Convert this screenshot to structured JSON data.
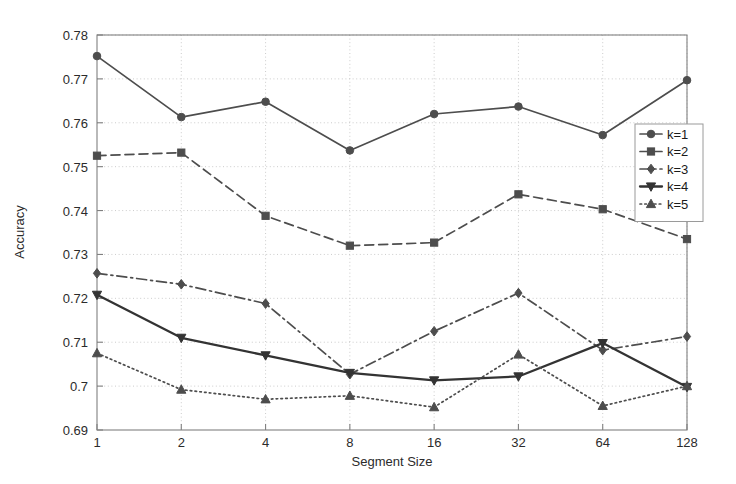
{
  "chart_data": {
    "type": "line",
    "title": "",
    "xlabel": "Segment Size",
    "ylabel": "Accuracy",
    "x": [
      1,
      2,
      4,
      8,
      16,
      32,
      64,
      128
    ],
    "xtick_labels": [
      "1",
      "2",
      "4",
      "8",
      "16",
      "32",
      "64",
      "128"
    ],
    "xscale": "log2-categorical",
    "ytick_labels": [
      "0.69",
      "0.7",
      "0.71",
      "0.72",
      "0.73",
      "0.74",
      "0.75",
      "0.76",
      "0.77",
      "0.78"
    ],
    "ytick_values": [
      0.69,
      0.7,
      0.71,
      0.72,
      0.73,
      0.74,
      0.75,
      0.76,
      0.77,
      0.78
    ],
    "ylim": [
      0.69,
      0.78
    ],
    "grid": true,
    "grid_style": "dotted",
    "legend_position": "center-right",
    "series": [
      {
        "name": "k=1",
        "label": "k=1",
        "linestyle": "solid",
        "marker": "circle",
        "color": "#4d4d4d",
        "values": [
          0.7752,
          0.7613,
          0.7648,
          0.7537,
          0.762,
          0.7637,
          0.7572,
          0.7697
        ]
      },
      {
        "name": "k=2",
        "label": "k=2",
        "linestyle": "dashed",
        "marker": "square",
        "color": "#4d4d4d",
        "values": [
          0.7525,
          0.7532,
          0.7388,
          0.732,
          0.7327,
          0.7437,
          0.7403,
          0.7335
        ]
      },
      {
        "name": "k=3",
        "label": "k=3",
        "linestyle": "dashdot",
        "marker": "diamond",
        "color": "#4d4d4d",
        "values": [
          0.7257,
          0.7232,
          0.7188,
          0.7027,
          0.7125,
          0.7212,
          0.7082,
          0.7113
        ]
      },
      {
        "name": "k=4",
        "label": "k=4",
        "linestyle": "solid-bold",
        "marker": "triangle-down",
        "color": "#333333",
        "values": [
          0.7208,
          0.711,
          0.707,
          0.703,
          0.7013,
          0.7022,
          0.7098,
          0.6998
        ]
      },
      {
        "name": "k=5",
        "label": "k=5",
        "linestyle": "dotted",
        "marker": "triangle-up",
        "color": "#4d4d4d",
        "values": [
          0.7075,
          0.6992,
          0.697,
          0.6978,
          0.6952,
          0.7072,
          0.6955,
          0.7
        ]
      }
    ]
  },
  "axes": {
    "frame_color": "#808080",
    "grid_color": "#bfbfbf"
  }
}
